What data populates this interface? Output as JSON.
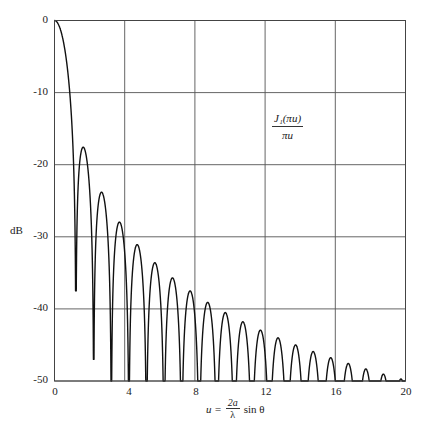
{
  "chart_data": {
    "type": "line",
    "title": "",
    "xlabel": "u = (2a/λ) sin θ",
    "ylabel": "dB",
    "annotation": {
      "numerator": "J₁(πu)",
      "denominator": "πu"
    },
    "xlim": [
      0,
      20
    ],
    "ylim": [
      -50,
      0
    ],
    "x_ticks": [
      0,
      4,
      8,
      12,
      16,
      20
    ],
    "y_ticks": [
      0,
      -10,
      -20,
      -30,
      -40,
      -50
    ],
    "grid": true,
    "legend": null,
    "series": [
      {
        "name": "J1(pi u)/(pi u) pattern (dB)",
        "function": "20*log10(|2*J1(pi*u)/(pi*u)|), clipped at -50 dB",
        "main_lobe": {
          "u": 0,
          "dB": 0
        },
        "sidelobe_peaks": [
          {
            "u": 1.64,
            "dB": -17.6
          },
          {
            "u": 2.68,
            "dB": -23.8
          },
          {
            "u": 3.7,
            "dB": -28.0
          },
          {
            "u": 4.71,
            "dB": -31.1
          },
          {
            "u": 5.72,
            "dB": -33.6
          },
          {
            "u": 6.72,
            "dB": -35.7
          },
          {
            "u": 7.73,
            "dB": -37.5
          },
          {
            "u": 8.73,
            "dB": -39.0
          },
          {
            "u": 9.73,
            "dB": -40.4
          },
          {
            "u": 10.73,
            "dB": -41.7
          },
          {
            "u": 11.73,
            "dB": -42.8
          },
          {
            "u": 12.74,
            "dB": -43.8
          },
          {
            "u": 13.74,
            "dB": -44.8
          },
          {
            "u": 14.74,
            "dB": -45.6
          },
          {
            "u": 15.74,
            "dB": -46.4
          },
          {
            "u": 16.74,
            "dB": -47.2
          },
          {
            "u": 17.74,
            "dB": -47.9
          },
          {
            "u": 18.74,
            "dB": -48.6
          },
          {
            "u": 19.74,
            "dB": -49.2
          }
        ],
        "nulls_u": [
          1.22,
          2.23,
          3.24,
          4.24,
          5.24,
          6.24,
          7.25,
          8.25,
          9.25,
          10.25,
          11.25,
          12.25,
          13.25,
          14.25,
          15.25,
          16.25,
          17.25,
          18.25,
          19.25
        ],
        "null_depths_visible_dB": [
          -37.5,
          -47,
          -50
        ]
      }
    ]
  },
  "labels": {
    "y_ticks": [
      "0",
      "-10",
      "-20",
      "-30",
      "-40",
      "-50"
    ],
    "x_ticks": [
      "0",
      "4",
      "8",
      "12",
      "16",
      "20"
    ],
    "ylabel": "dB",
    "annot_num": "J₁(πu)",
    "annot_den": "πu",
    "xlabel_u": "u =",
    "xlabel_frac_num": "2a",
    "xlabel_frac_den": "λ",
    "xlabel_tail": "sin θ"
  },
  "colors": {
    "line": "#111111",
    "grid": "#555555",
    "background": "#ffffff"
  }
}
